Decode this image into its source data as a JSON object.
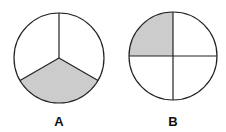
{
  "figures": [
    {
      "label": "A",
      "parts": 3,
      "shaded": 1,
      "fraction": "1/3",
      "cx": 59,
      "cy": 58,
      "r": 45
    },
    {
      "label": "B",
      "parts": 4,
      "shaded": 1,
      "fraction": "1/4",
      "cx": 173,
      "cy": 56,
      "r": 44
    }
  ],
  "colors": {
    "shade": "#cccccc",
    "stroke": "#222222"
  }
}
